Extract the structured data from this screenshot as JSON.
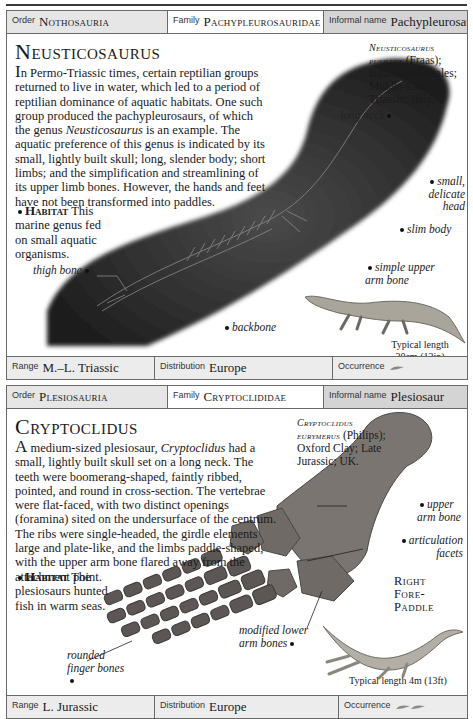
{
  "entries": [
    {
      "header": {
        "order_label": "Order",
        "order_value": "Nothosauria",
        "family_label": "Family",
        "family_value": "Pachypleurosauridae",
        "informal_label": "Informal name",
        "informal_value": "Pachypleurosaurid"
      },
      "title": "Neusticosaurus",
      "description": {
        "dropcap": "I",
        "text_before_italic": "n Permo-Triassic times, certain reptilian groups returned to live in water, which led to a period of reptilian dominance of aquatic habitats. One such group produced the pachypleurosaurs, of which the genus ",
        "italic": "Neusticosaurus",
        "text_after_italic": " is an example. The aquatic preference of this genus is indicated by its small, lightly built skull; long, slender body; short limbs; and the simplification and streamlining of its upper limb bones. However, the hands and feet have not been transformed into paddles."
      },
      "habitat": {
        "label": "Habitat",
        "text": "This marine genus fed on small aquatic organisms."
      },
      "specimen": {
        "species": "Neusticosaurus pusillus",
        "details": "(Fraas); Bituminous shales; Middle-Late Triassic; Italy."
      },
      "annotations": {
        "long_neck": "long neck",
        "small_head": "small, delicate head",
        "slim_body": "slim body",
        "upper_arm": "simple upper arm bone",
        "thigh_bone": "thigh bone",
        "backbone": "backbone"
      },
      "typical_length": "Typical length 30cm (12in)",
      "footer": {
        "range_label": "Range",
        "range_value": "M.–L. Triassic",
        "distribution_label": "Distribution",
        "distribution_value": "Europe",
        "occurrence_label": "Occurrence",
        "occurrence_icon": "fossil-occurrence-icon",
        "occurrence_count": 1
      }
    },
    {
      "header": {
        "order_label": "Order",
        "order_value": "Plesiosauria",
        "family_label": "Family",
        "family_value": "Cryptoclididae",
        "informal_label": "Informal name",
        "informal_value": "Plesiosaur"
      },
      "title": "Cryptoclidus",
      "description": {
        "dropcap": "A",
        "text_before_italic": " medium-sized plesiosaur, ",
        "italic": "Cryptoclidus",
        "text_after_italic": " had a small, lightly built skull set on a long neck. The teeth were boomerang-shaped, faintly ribbed, pointed, and round in cross-section. The vertebrae were flat-faced, with two distinct openings (foramina) sited on the undersurface of the centrum. The ribs were single-headed, the girdle elements large and plate-like, and the limbs paddle-shaped, with the upper arm bone flared away from the attachment point."
      },
      "habitat": {
        "label": "Habitat",
        "text": "The plesiosaurs hunted fish in warm seas."
      },
      "specimen": {
        "species": "Cryptoclidus eurymerus",
        "details": "(Philips); Oxford Clay; Late Jurassic; UK."
      },
      "annotations": {
        "upper_arm": "upper arm bone",
        "articulation": "articulation facets",
        "paddle": "Right Fore-Paddle",
        "lower_arm": "modified lower arm bones",
        "finger": "rounded finger bones"
      },
      "typical_length": "Typical length 4m (13ft)",
      "footer": {
        "range_label": "Range",
        "range_value": "L. Jurassic",
        "distribution_label": "Distribution",
        "distribution_value": "Europe",
        "occurrence_label": "Occurrence",
        "occurrence_icon": "fossil-occurrence-icon",
        "occurrence_count": 2
      }
    }
  ]
}
